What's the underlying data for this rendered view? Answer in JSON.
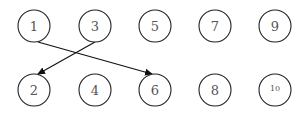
{
  "diagram": {
    "type": "directed-graph",
    "nodes": [
      {
        "id": "1",
        "label": "1",
        "cx": 34,
        "cy": 26
      },
      {
        "id": "3",
        "label": "3",
        "cx": 95,
        "cy": 26
      },
      {
        "id": "5",
        "label": "5",
        "cx": 155,
        "cy": 26
      },
      {
        "id": "7",
        "label": "7",
        "cx": 215,
        "cy": 26
      },
      {
        "id": "9",
        "label": "9",
        "cx": 275,
        "cy": 26
      },
      {
        "id": "2",
        "label": "2",
        "cx": 34,
        "cy": 90
      },
      {
        "id": "4",
        "label": "4",
        "cx": 95,
        "cy": 90
      },
      {
        "id": "6",
        "label": "6",
        "cx": 155,
        "cy": 90
      },
      {
        "id": "8",
        "label": "8",
        "cx": 215,
        "cy": 90
      },
      {
        "id": "10",
        "label": "10",
        "cx": 275,
        "cy": 90
      }
    ],
    "edges": [
      {
        "from": "1",
        "to": "6"
      },
      {
        "from": "3",
        "to": "2"
      }
    ]
  }
}
